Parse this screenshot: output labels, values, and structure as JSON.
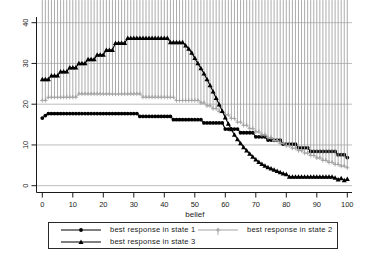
{
  "chart_data": {
    "type": "line",
    "title": "",
    "xlabel": "belief",
    "ylabel": "",
    "xlim": [
      0,
      100
    ],
    "ylim": [
      0,
      40
    ],
    "x_ticks": [
      0,
      10,
      20,
      30,
      40,
      50,
      60,
      70,
      80,
      90,
      100
    ],
    "y_ticks": [
      0,
      10,
      20,
      30,
      40
    ],
    "grid": "horizontal",
    "legend_position": "bottom",
    "style": {
      "grid_color": "#b6b6b6",
      "axis_color": "#1a1a1a",
      "tick_label_color": "#1a1a1a",
      "background": "#ffffff"
    },
    "x_step": 1,
    "series": [
      {
        "name": "best response in state 1",
        "marker": "circle",
        "color": "#000000",
        "values": [
          16.6,
          17.2,
          17.7,
          17.7,
          17.7,
          17.7,
          17.7,
          17.7,
          17.7,
          17.7,
          17.7,
          17.7,
          17.7,
          17.7,
          17.7,
          17.7,
          17.7,
          17.7,
          17.7,
          17.7,
          17.7,
          17.7,
          17.7,
          17.7,
          17.7,
          17.7,
          17.7,
          17.7,
          17.7,
          17.7,
          17.7,
          17.7,
          17,
          17,
          17,
          17,
          17,
          17,
          17,
          17,
          17,
          17,
          17,
          16.2,
          16.2,
          16.2,
          16.2,
          16.2,
          16.2,
          16.2,
          16.2,
          16.2,
          16.2,
          15.4,
          15.4,
          15.4,
          15.4,
          15.4,
          15.4,
          15.4,
          13.9,
          13.9,
          13.9,
          13.9,
          13.9,
          13,
          13,
          13,
          13,
          13,
          12,
          12,
          12,
          12,
          11.2,
          11.2,
          11.2,
          11.2,
          11.2,
          10.2,
          10.2,
          10.2,
          10.2,
          10.2,
          9.3,
          9.3,
          9.3,
          9.3,
          8.4,
          8.4,
          8.4,
          8.4,
          8.4,
          8.4,
          8.4,
          8.4,
          8.4,
          7.6,
          7.6,
          7.6,
          6.9
        ]
      },
      {
        "name": "best response in state 2",
        "marker": "plus",
        "color": "#a3a3a3",
        "values": [
          20.9,
          20.9,
          21.7,
          21.7,
          21.7,
          21.7,
          21.7,
          21.7,
          21.7,
          21.7,
          21.7,
          21.7,
          22.5,
          22.5,
          22.5,
          22.5,
          22.5,
          22.5,
          22.5,
          22.5,
          22.5,
          22.5,
          22.5,
          22.5,
          22.5,
          22.5,
          22.5,
          22.5,
          22.5,
          22.5,
          22.5,
          22.5,
          22.5,
          21.7,
          21.7,
          21.7,
          21.7,
          21.7,
          21.7,
          21.7,
          21.7,
          21.7,
          21.7,
          21.7,
          20.9,
          20.9,
          20.9,
          20.9,
          20.9,
          20.9,
          20.9,
          20.9,
          20.3,
          20.3,
          19.6,
          19.6,
          18.9,
          18.9,
          18.2,
          18.2,
          17.4,
          17.4,
          16.5,
          16.5,
          15.6,
          15.6,
          14.8,
          14.8,
          14,
          14,
          13.2,
          13.2,
          12.5,
          12.5,
          11.8,
          11.8,
          11.1,
          11.1,
          10.4,
          10.4,
          9.8,
          9.8,
          9.2,
          9.2,
          8.6,
          8.6,
          8,
          8,
          7.4,
          7.4,
          6.8,
          6.8,
          6.2,
          6.2,
          5.7,
          5.7,
          5.2,
          5.2,
          4.8,
          4.8,
          4.4
        ]
      },
      {
        "name": "best response in state 3",
        "marker": "triangle",
        "color": "#000000",
        "values": [
          26.1,
          26.1,
          26.1,
          27,
          27,
          27,
          28,
          28,
          28,
          29,
          29,
          29,
          30,
          30,
          30,
          31,
          31,
          31,
          32.1,
          32.1,
          32.1,
          33.3,
          33.3,
          33.3,
          35,
          35,
          35,
          35,
          36.2,
          36.2,
          36.2,
          36.2,
          36.2,
          36.2,
          36.2,
          36.2,
          36.2,
          36.2,
          36.2,
          36.2,
          36.2,
          36.2,
          35.2,
          35.2,
          35.2,
          35.2,
          35.2,
          34.4,
          33.6,
          32.6,
          31.3,
          30,
          28.8,
          27.5,
          26.1,
          24.6,
          23.1,
          21.5,
          19.9,
          18.3,
          16.7,
          15.2,
          13.8,
          12.5,
          11.4,
          10.4,
          9.4,
          8.6,
          7.8,
          7.1,
          6.4,
          5.8,
          5.3,
          4.9,
          4.5,
          4.2,
          3.9,
          3.6,
          3.3,
          3,
          2.8,
          2.2,
          2.2,
          2.2,
          2.2,
          2.2,
          2.2,
          2.2,
          2.2,
          2.2,
          2.2,
          2.2,
          2.2,
          2.2,
          2.2,
          2.2,
          1.9,
          1.5,
          1.8,
          1.3,
          1.6
        ]
      }
    ]
  },
  "legend": {
    "items": [
      {
        "label": "best response in state 1",
        "marker": "circle",
        "color": "#000000"
      },
      {
        "label": "best response in state 2",
        "marker": "plus",
        "color": "#a3a3a3"
      },
      {
        "label": "best response in state 3",
        "marker": "triangle",
        "color": "#000000"
      }
    ]
  }
}
